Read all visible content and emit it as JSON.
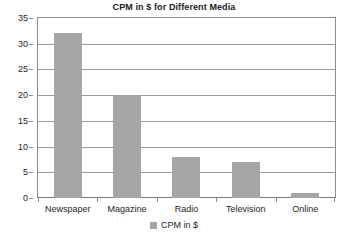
{
  "chart_data": {
    "type": "bar",
    "title": "CPM in $ for Different Media",
    "categories": [
      "Newspaper",
      "Magazine",
      "Radio",
      "Television",
      "Online"
    ],
    "values": [
      32,
      20,
      8,
      7,
      1
    ],
    "series": [
      {
        "name": "CPM in $",
        "values": [
          32,
          20,
          8,
          7,
          1
        ]
      }
    ],
    "xlabel": "",
    "ylabel": "",
    "ylim": [
      0,
      35
    ],
    "yticks": [
      0,
      5,
      10,
      15,
      20,
      25,
      30,
      35
    ],
    "ytick_labels": [
      "0",
      "5",
      "10",
      "15",
      "20",
      "25",
      "30",
      "35"
    ],
    "grid": true,
    "legend": {
      "position": "bottom",
      "entries": [
        "CPM in $"
      ]
    },
    "colors": {
      "bar": "#a6a6a6",
      "gridline": "#9a9a9a",
      "axis": "#8c8c8c",
      "text": "#231f20",
      "background": "#ffffff"
    }
  }
}
